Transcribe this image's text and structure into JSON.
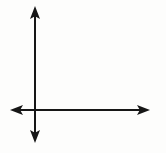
{
  "figure": {
    "type": "diagram",
    "width": 166,
    "height": 153,
    "background_color": "#fdfdfc",
    "stroke_color": "#161616",
    "stroke_width": 2
  },
  "chart_data": {
    "type": "diagram",
    "title": "",
    "xlabel": "",
    "ylabel": "",
    "grid": false,
    "legend": false,
    "origin": {
      "x": 35,
      "y": 110
    },
    "axes": [
      {
        "name": "x-axis",
        "orientation": "horizontal",
        "y": 110,
        "start_x": 10,
        "end_x": 150,
        "arrowheads": [
          "left",
          "right"
        ],
        "tick_labels": []
      },
      {
        "name": "y-axis",
        "orientation": "vertical",
        "x": 35,
        "start_y": 6,
        "end_y": 143,
        "arrowheads": [
          "up",
          "down"
        ],
        "tick_labels": []
      }
    ],
    "annotations": []
  },
  "arrows": {
    "up": {
      "label": "up-arrowhead",
      "tip_x": 35,
      "tip_y": 6,
      "half_width": 5,
      "length": 13
    },
    "down": {
      "label": "down-arrowhead",
      "tip_x": 35,
      "tip_y": 143,
      "half_width": 5,
      "length": 13
    },
    "left": {
      "label": "left-arrowhead",
      "tip_x": 10,
      "tip_y": 110,
      "half_width": 5,
      "length": 13
    },
    "right": {
      "label": "right-arrowhead",
      "tip_x": 150,
      "tip_y": 110,
      "half_width": 5,
      "length": 13
    }
  }
}
